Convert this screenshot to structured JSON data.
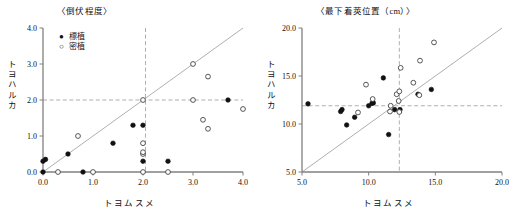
{
  "figure": {
    "background": "#ffffff",
    "foreground": "#111111",
    "axis_color": "#808080",
    "guide_color": "#9a9a9a",
    "marker_filled_color": "#111111",
    "marker_open_color": "#ffffff",
    "marker_open_stroke": "#444444"
  },
  "legend": {
    "items": [
      {
        "marker": "filled-circle",
        "glyph": "●",
        "label": "標植"
      },
      {
        "marker": "open-circle",
        "glyph": "○",
        "label": "密植"
      }
    ]
  },
  "chart_data": [
    {
      "id": "lodging-degree",
      "type": "scatter",
      "title": "〈倒伏程度〉",
      "xlabel": "トヨムスメ",
      "ylabel": "トヨハルカ",
      "xlim": [
        0.0,
        4.0
      ],
      "ylim": [
        0.0,
        4.0
      ],
      "xticks": [
        0.0,
        1.0,
        2.0,
        3.0,
        4.0
      ],
      "yticks": [
        0.0,
        1.0,
        2.0,
        3.0,
        4.0
      ],
      "xtick_labels": [
        "0.0",
        "1.0",
        "2.0",
        "3.0",
        "4.0"
      ],
      "ytick_labels": [
        "0.0",
        "1.0",
        "2.0",
        "3.0",
        "4.0"
      ],
      "grid": false,
      "legend_position": "top-left",
      "reference_line": {
        "type": "identity",
        "from": [
          0.0,
          0.0
        ],
        "to": [
          4.0,
          4.0
        ]
      },
      "guides": [
        {
          "orientation": "vertical",
          "value": 2.05,
          "style": "dashed"
        },
        {
          "orientation": "horizontal",
          "value": 2.0,
          "style": "dashed"
        }
      ],
      "series": [
        {
          "name": "標植",
          "marker": "filled-circle",
          "points": [
            [
              0.0,
              0.0
            ],
            [
              0.0,
              0.3
            ],
            [
              0.05,
              0.35
            ],
            [
              0.5,
              0.5
            ],
            [
              0.8,
              0.0
            ],
            [
              1.4,
              0.8
            ],
            [
              1.8,
              1.3
            ],
            [
              2.0,
              1.3
            ],
            [
              2.0,
              0.3
            ],
            [
              2.5,
              0.3
            ],
            [
              3.7,
              2.0
            ]
          ]
        },
        {
          "name": "密植",
          "marker": "open-circle",
          "points": [
            [
              0.3,
              0.0
            ],
            [
              0.7,
              1.0
            ],
            [
              1.0,
              0.0
            ],
            [
              2.0,
              0.0
            ],
            [
              2.0,
              0.5
            ],
            [
              2.0,
              0.55
            ],
            [
              2.0,
              0.8
            ],
            [
              2.0,
              2.0
            ],
            [
              2.5,
              0.0
            ],
            [
              3.0,
              3.0
            ],
            [
              3.0,
              2.0
            ],
            [
              3.2,
              1.45
            ],
            [
              3.3,
              2.65
            ],
            [
              3.3,
              1.2
            ],
            [
              4.0,
              1.75
            ]
          ]
        }
      ]
    },
    {
      "id": "lowest-pod-height",
      "type": "scatter",
      "title": "〈最下着莢位置（cm）〉",
      "xlabel": "トヨムスメ",
      "ylabel": "トヨハルカ",
      "xlim": [
        5.0,
        20.0
      ],
      "ylim": [
        5.0,
        20.0
      ],
      "xticks": [
        5.0,
        10.0,
        15.0,
        20.0
      ],
      "yticks": [
        5.0,
        10.0,
        15.0,
        20.0
      ],
      "xtick_labels": [
        "5.0",
        "10.0",
        "15.0",
        "20.0"
      ],
      "ytick_labels": [
        "5.0",
        "10.0",
        "15.0",
        "20.0"
      ],
      "grid": false,
      "legend_position": "none",
      "reference_line": {
        "type": "identity",
        "from": [
          5.0,
          5.0
        ],
        "to": [
          20.0,
          20.0
        ]
      },
      "guides": [
        {
          "orientation": "vertical",
          "value": 12.3,
          "style": "dashed"
        },
        {
          "orientation": "horizontal",
          "value": 11.9,
          "style": "dashed"
        }
      ],
      "series": [
        {
          "name": "標植",
          "marker": "filled-circle",
          "points": [
            [
              5.45,
              12.1
            ],
            [
              7.9,
              11.3
            ],
            [
              8.0,
              11.5
            ],
            [
              8.35,
              9.9
            ],
            [
              8.95,
              10.7
            ],
            [
              10.0,
              11.9
            ],
            [
              10.25,
              12.15
            ],
            [
              10.35,
              12.2
            ],
            [
              11.1,
              14.8
            ],
            [
              11.5,
              8.9
            ],
            [
              11.95,
              11.5
            ],
            [
              12.35,
              11.5
            ],
            [
              13.7,
              13.1
            ],
            [
              14.7,
              13.6
            ]
          ]
        },
        {
          "name": "密植",
          "marker": "open-circle",
          "points": [
            [
              9.2,
              11.2
            ],
            [
              9.8,
              14.1
            ],
            [
              10.3,
              12.6
            ],
            [
              11.6,
              11.3
            ],
            [
              11.65,
              11.9
            ],
            [
              12.1,
              13.1
            ],
            [
              12.25,
              12.4
            ],
            [
              12.3,
              11.25
            ],
            [
              12.3,
              13.4
            ],
            [
              12.4,
              15.85
            ],
            [
              13.35,
              14.3
            ],
            [
              13.8,
              13.0
            ],
            [
              13.85,
              16.6
            ],
            [
              14.9,
              18.5
            ]
          ]
        }
      ]
    }
  ]
}
